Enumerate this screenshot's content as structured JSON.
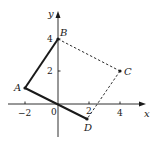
{
  "diagram": {
    "axes": {
      "x_label": "x",
      "y_label": "y",
      "origin_label": "0",
      "x_ticks": [
        {
          "value": -2,
          "label": "−2"
        },
        {
          "value": 2,
          "label": "2"
        },
        {
          "value": 4,
          "label": "4"
        }
      ],
      "y_ticks": [
        {
          "value": 2,
          "label": "2"
        },
        {
          "value": 4,
          "label": "4"
        }
      ]
    },
    "points": [
      {
        "name": "A",
        "x": -2,
        "y": 1
      },
      {
        "name": "B",
        "x": 0,
        "y": 4
      },
      {
        "name": "C",
        "x": 4,
        "y": 2
      },
      {
        "name": "D",
        "x": 2,
        "y": -1
      }
    ],
    "segments": [
      {
        "from": "A",
        "to": "B",
        "style": "solid"
      },
      {
        "from": "A",
        "to": "D",
        "style": "solid"
      },
      {
        "from": "B",
        "to": "C",
        "style": "dashed"
      },
      {
        "from": "C",
        "to": "D",
        "style": "dashed"
      }
    ],
    "colors": {
      "ink": "#1a1a1a",
      "background": "#ffffff"
    }
  }
}
